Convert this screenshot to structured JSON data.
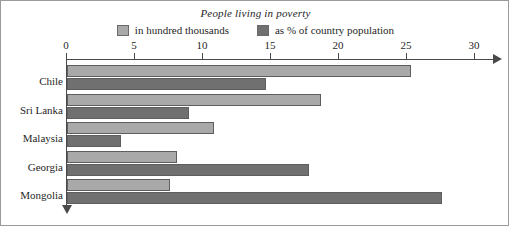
{
  "chart_data": {
    "type": "bar",
    "orientation": "horizontal",
    "title": "People living in poverty",
    "xlabel": "",
    "ylabel": "",
    "xlim": [
      0,
      30
    ],
    "xticks": [
      0,
      5,
      10,
      15,
      20,
      25,
      30
    ],
    "grid": false,
    "legend_position": "top-center",
    "categories": [
      "Chile",
      "Sri Lanka",
      "Malaysia",
      "Georgia",
      "Mongolia"
    ],
    "series": [
      {
        "name": "in hundred thousands",
        "color": "#a9a9a9",
        "values": [
          25.3,
          18.7,
          10.8,
          8.1,
          7.6
        ]
      },
      {
        "name": "as % of country population",
        "color": "#707070",
        "values": [
          14.6,
          9.0,
          4.0,
          17.8,
          27.6
        ]
      }
    ]
  },
  "legend": {
    "items": [
      {
        "label": "in hundred thousands",
        "swatch": "series-light"
      },
      {
        "label": "as % of country population",
        "swatch": "series-dark"
      }
    ]
  },
  "axis": {
    "tick_labels": [
      "0",
      "5",
      "10",
      "15",
      "20",
      "25",
      "30"
    ]
  },
  "colors": {
    "series_light": "#a9a9a9",
    "series_dark": "#707070",
    "axis": "#4a4a4a",
    "frame": "#9a9a9a"
  }
}
